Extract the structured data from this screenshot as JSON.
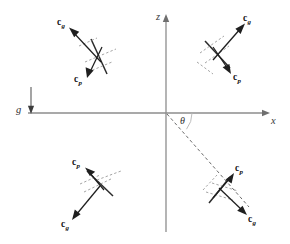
{
  "figure": {
    "background_color": "#ffffff",
    "width": 290,
    "height": 244
  },
  "axes": {
    "x_label": "x",
    "z_label": "z",
    "axis_color": "#8d8d8d",
    "origin": {
      "x": 166,
      "y": 113
    }
  },
  "gravity": {
    "label": "g",
    "direction": "down",
    "color": "#3d3d3d"
  },
  "angle": {
    "symbol": "θ",
    "measured_from": "x",
    "color": "#2f2f2f"
  },
  "ray": {
    "style": "dashed",
    "color": "#6b6b6b",
    "from": "origin",
    "to": "fourth-quadrant-object"
  },
  "vector_labels": {
    "cg": {
      "base": "c",
      "subscript": "g"
    },
    "cp": {
      "base": "c",
      "subscript": "p"
    }
  },
  "objects": [
    {
      "quadrant": "top-left",
      "cg_label_base": "c",
      "cg_label_sub": "g",
      "cp_label_base": "c",
      "cp_label_sub": "p",
      "cg_direction": "up-left",
      "cp_direction": "down-left"
    },
    {
      "quadrant": "top-right",
      "cg_label_base": "c",
      "cg_label_sub": "g",
      "cp_label_base": "c",
      "cp_label_sub": "p",
      "cg_direction": "up-right",
      "cp_direction": "down-right"
    },
    {
      "quadrant": "bottom-left",
      "cg_label_base": "c",
      "cg_label_sub": "g",
      "cp_label_base": "c",
      "cp_label_sub": "p",
      "cg_direction": "down-left",
      "cp_direction": "up-left"
    },
    {
      "quadrant": "bottom-right",
      "cg_label_base": "c",
      "cg_label_sub": "g",
      "cp_label_base": "c",
      "cp_label_sub": "p",
      "cg_direction": "down-right",
      "cp_direction": "up-right"
    }
  ],
  "colors": {
    "vector": "#1f1f1f",
    "plate": "#2b2b2b",
    "plate_normal_dash": "#9a9a9a",
    "axis": "#8d8d8d",
    "ray": "#6b6b6b"
  }
}
